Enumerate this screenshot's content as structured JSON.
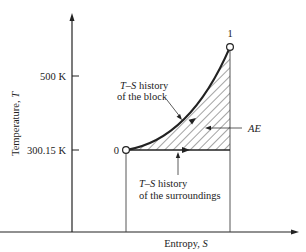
{
  "figure": {
    "y_axis": {
      "label_text": "Temperature, ",
      "label_symbol": "T",
      "ticks": [
        {
          "label": "500 K",
          "value": 500
        },
        {
          "label": "300.15 K",
          "value": 300.15
        }
      ]
    },
    "x_axis": {
      "label_text": "Entropy, ",
      "label_symbol": "S"
    },
    "points": [
      {
        "label": "0"
      },
      {
        "label": "1"
      }
    ],
    "annotations": {
      "block_line1_symbol": "T–S",
      "block_line1_text": " history",
      "block_line2": "of the block",
      "surroundings_line1_symbol": "T–S",
      "surroundings_line1_text": " history",
      "surroundings_line2": "of the surroundings",
      "shaded_region": "AE"
    },
    "colors": {
      "line": "#222222",
      "hatch": "#333333",
      "background": "#ffffff"
    }
  }
}
